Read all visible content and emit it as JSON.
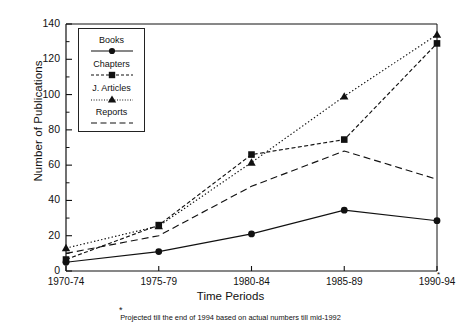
{
  "chart_data": {
    "type": "line",
    "title": "",
    "xlabel": "Time Periods",
    "ylabel": "Number of Publications",
    "categories": [
      "1970-74",
      "1975-79",
      "1980-84",
      "1985-89",
      "1990-94"
    ],
    "ylim": [
      0,
      140
    ],
    "yticks": [
      0,
      20,
      40,
      60,
      80,
      100,
      120,
      140
    ],
    "yminorticks": [
      10,
      30,
      50,
      70,
      90,
      110,
      130
    ],
    "grid": false,
    "legend_position": "upper-left-inside",
    "series": [
      {
        "name": "Books",
        "marker": "circle",
        "line": "solid",
        "values": [
          5,
          11,
          21,
          34.5,
          28.5
        ]
      },
      {
        "name": "Chapters",
        "marker": "square",
        "line": "dash-dot",
        "values": [
          6.5,
          26,
          66,
          74.5,
          129
        ]
      },
      {
        "name": "J. Articles",
        "marker": "triangle",
        "line": "dotted",
        "values": [
          13,
          25.5,
          61.5,
          99,
          134
        ]
      },
      {
        "name": "Reports",
        "marker": "none",
        "line": "dashed",
        "values": [
          10,
          20,
          48,
          68,
          52
        ]
      }
    ],
    "annotations": {
      "axis_asterisk": "*",
      "footnote_asterisk": "*",
      "footnote": "Projected till the end of 1994 based on actual numbers till mid-1992"
    }
  },
  "legend": {
    "items": [
      {
        "label": "Books"
      },
      {
        "label": "Chapters"
      },
      {
        "label": "J. Articles"
      },
      {
        "label": "Reports"
      }
    ]
  },
  "axes": {
    "y_tick_labels": [
      "0",
      "20",
      "40",
      "60",
      "80",
      "100",
      "120",
      "140"
    ],
    "x_tick_labels": [
      "1970-74",
      "1975-79",
      "1980-84",
      "1985-89",
      "1990-94"
    ]
  }
}
